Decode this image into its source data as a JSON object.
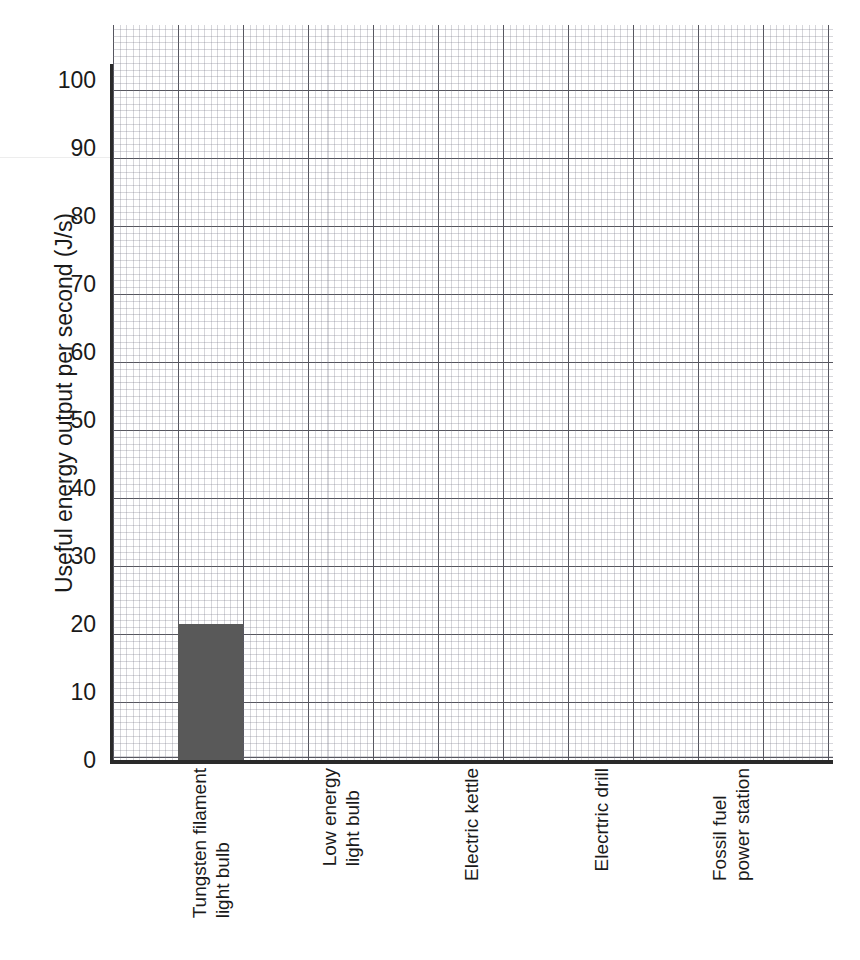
{
  "chart_data": {
    "type": "bar",
    "title": "",
    "xlabel": "",
    "ylabel": "Useful energy output per second (J/s)",
    "categories": [
      "Tungsten filament light bulb",
      "Low energy light bulb",
      "Electric kettle",
      "Elecrtric drill",
      "Fossil fuel power station"
    ],
    "category_lines": [
      [
        "Tungsten filament",
        "light bulb"
      ],
      [
        "Low energy",
        "light bulb"
      ],
      [
        "Electric kettle"
      ],
      [
        "Elecrtric drill"
      ],
      [
        "Fossil fuel",
        "power station"
      ]
    ],
    "values": [
      20,
      null,
      null,
      null,
      null
    ],
    "ylim": [
      0,
      108
    ],
    "ytick_values": [
      0,
      10,
      20,
      30,
      40,
      50,
      60,
      70,
      80,
      90,
      100
    ],
    "ytick_labels": [
      "0",
      "10",
      "20",
      "30",
      "40",
      "50",
      "60",
      "70",
      "80",
      "90",
      "100"
    ],
    "grid": true,
    "grid_style": "graph-paper",
    "legend": "none",
    "bar_color": "#595959",
    "axis_color": "#2a2a2a",
    "major_grid_color": "#373740",
    "minor_grid_color": "#7878871a"
  }
}
